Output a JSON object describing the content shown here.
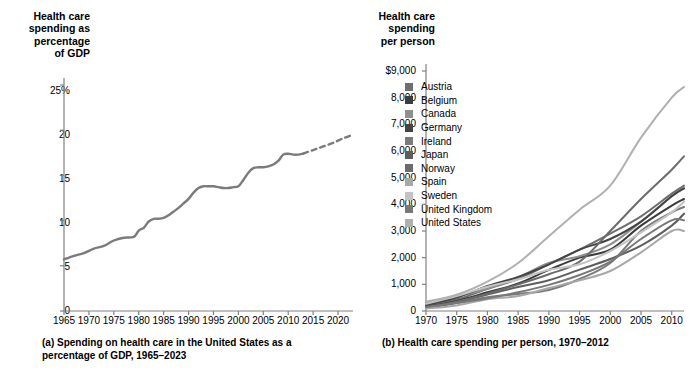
{
  "figure": {
    "background": "#ffffff",
    "ink": "#000000",
    "axis_color": "#808080"
  },
  "panel_a": {
    "axis_title": "Health care\nspending as\npercentage\nof GDP",
    "caption_index": "(a)",
    "caption_text": "Spending on health care in the United States as a percentage of GDP, 1965–2023",
    "line_color": "#7b7b7b",
    "yticks": [
      "0",
      "5",
      "10",
      "15",
      "20",
      "25%"
    ],
    "xticks": [
      "1965",
      "1970",
      "1975",
      "1980",
      "1985",
      "1990",
      "1995",
      "2000",
      "2005",
      "2010",
      "2015",
      "2020"
    ]
  },
  "panel_b": {
    "axis_title": "Health care\nspending\nper person",
    "caption_index": "(b)",
    "caption_text": "Health care spending per person, 1970–2012",
    "yticks": [
      "0",
      "1,000",
      "2,000",
      "3,000",
      "4,000",
      "5,000",
      "6,000",
      "7,000",
      "8,000",
      "$9,000"
    ],
    "xticks": [
      "1970",
      "1975",
      "1980",
      "1985",
      "1990",
      "1995",
      "2000",
      "2005",
      "2010"
    ],
    "legend": [
      {
        "label": "Austria",
        "color": "#6e6e6e"
      },
      {
        "label": "Belgium",
        "color": "#3b3b3b"
      },
      {
        "label": "Canada",
        "color": "#8f8f8f"
      },
      {
        "label": "Germany",
        "color": "#444444"
      },
      {
        "label": "Ireland",
        "color": "#7a7a7a"
      },
      {
        "label": "Japan",
        "color": "#5e5e5e"
      },
      {
        "label": "Norway",
        "color": "#6b6b6b"
      },
      {
        "label": "Spain",
        "color": "#a8a8a8"
      },
      {
        "label": "Sweden",
        "color": "#c3c3c3"
      },
      {
        "label": "United Kingdom",
        "color": "#787878"
      },
      {
        "label": "United States",
        "color": "#b0b0b0"
      }
    ]
  },
  "chart_data": [
    {
      "type": "line",
      "id": "panel-a",
      "title": "Spending on health care in the United States as a percentage of GDP, 1965–2023",
      "xlabel": "",
      "ylabel": "Health care spending as percentage of GDP",
      "xlim": [
        1965,
        2023
      ],
      "ylim": [
        0,
        27
      ],
      "yticks": [
        0,
        5,
        10,
        15,
        20,
        25
      ],
      "xticks": [
        1965,
        1970,
        1975,
        1980,
        1985,
        1990,
        1995,
        2000,
        2005,
        2010,
        2015,
        2020
      ],
      "grid": false,
      "legend": "none",
      "series": [
        {
          "name": "Actual",
          "style": "solid",
          "color": "#7b7b7b",
          "x": [
            1965,
            1967,
            1969,
            1971,
            1973,
            1975,
            1977,
            1979,
            1980,
            1981,
            1982,
            1983,
            1984,
            1985,
            1986,
            1987,
            1988,
            1989,
            1990,
            1991,
            1992,
            1993,
            1994,
            1995,
            1996,
            1997,
            1998,
            1999,
            2000,
            2001,
            2002,
            2003,
            2004,
            2005,
            2006,
            2007,
            2008,
            2009,
            2010,
            2011,
            2012,
            2013
          ],
          "y": [
            5.7,
            6.1,
            6.4,
            6.9,
            7.2,
            7.8,
            8.1,
            8.2,
            8.9,
            9.2,
            9.9,
            10.2,
            10.2,
            10.3,
            10.6,
            11.0,
            11.4,
            11.9,
            12.4,
            13.1,
            13.6,
            13.8,
            13.8,
            13.8,
            13.7,
            13.6,
            13.6,
            13.7,
            13.8,
            14.5,
            15.3,
            15.8,
            15.9,
            15.9,
            16.0,
            16.2,
            16.6,
            17.3,
            17.4,
            17.3,
            17.3,
            17.4
          ]
        },
        {
          "name": "Projected",
          "style": "dashed",
          "color": "#7b7b7b",
          "x": [
            2013,
            2015,
            2017,
            2019,
            2021,
            2023
          ],
          "y": [
            17.4,
            17.8,
            18.2,
            18.6,
            19.1,
            19.5
          ]
        }
      ]
    },
    {
      "type": "line",
      "id": "panel-b",
      "title": "Health care spending per person, 1970–2012",
      "xlabel": "",
      "ylabel": "Health care spending per person",
      "xlim": [
        1970,
        2012
      ],
      "ylim": [
        0,
        9300
      ],
      "yticks": [
        0,
        1000,
        2000,
        3000,
        4000,
        5000,
        6000,
        7000,
        8000,
        9000
      ],
      "xticks": [
        1970,
        1975,
        1980,
        1985,
        1990,
        1995,
        2000,
        2005,
        2010
      ],
      "grid": false,
      "legend": "inside-upper-left",
      "x": [
        1970,
        1975,
        1980,
        1985,
        1990,
        1995,
        2000,
        2005,
        2010,
        2012
      ],
      "series": [
        {
          "name": "Austria",
          "color": "#6e6e6e",
          "values": [
            190,
            430,
            830,
            1200,
            1750,
            2300,
            2900,
            3550,
            4400,
            4700
          ]
        },
        {
          "name": "Belgium",
          "color": "#3b3b3b",
          "values": [
            150,
            380,
            700,
            1030,
            1540,
            2000,
            2300,
            3200,
            3950,
            4200
          ]
        },
        {
          "name": "Canada",
          "color": "#8f8f8f",
          "values": [
            290,
            540,
            830,
            1260,
            1800,
            2050,
            2500,
            3350,
            4300,
            4600
          ]
        },
        {
          "name": "Germany",
          "color": "#444444",
          "values": [
            220,
            500,
            940,
            1280,
            1750,
            2300,
            2700,
            3350,
            4300,
            4600
          ]
        },
        {
          "name": "Ireland",
          "color": "#7a7a7a",
          "values": [
            110,
            300,
            520,
            640,
            790,
            1200,
            1800,
            3000,
            3700,
            3900
          ]
        },
        {
          "name": "Japan",
          "color": "#5e5e5e",
          "values": [
            130,
            330,
            620,
            900,
            1150,
            1550,
            1950,
            2450,
            3200,
            3650
          ]
        },
        {
          "name": "Norway",
          "color": "#6b6b6b",
          "values": [
            130,
            350,
            650,
            1000,
            1380,
            1850,
            3000,
            4200,
            5300,
            5800
          ]
        },
        {
          "name": "Spain",
          "color": "#a8a8a8",
          "values": [
            90,
            210,
            440,
            560,
            860,
            1150,
            1500,
            2200,
            3000,
            3000
          ]
        },
        {
          "name": "Sweden",
          "color": "#c3c3c3",
          "values": [
            270,
            560,
            910,
            1180,
            1550,
            1750,
            2250,
            2950,
            3700,
            4100
          ]
        },
        {
          "name": "United Kingdom",
          "color": "#787878",
          "values": [
            150,
            300,
            480,
            700,
            980,
            1350,
            1850,
            2700,
            3400,
            3400
          ]
        },
        {
          "name": "United States",
          "color": "#b0b0b0",
          "values": [
            350,
            610,
            1100,
            1800,
            2800,
            3800,
            4700,
            6500,
            8000,
            8400
          ]
        }
      ]
    }
  ]
}
